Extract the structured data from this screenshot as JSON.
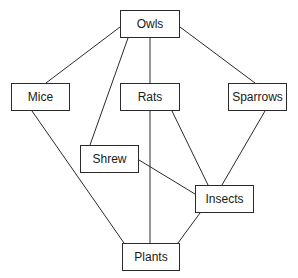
{
  "diagram": {
    "type": "food-web",
    "nodes": [
      {
        "id": "owls",
        "label": "Owls",
        "x": 120,
        "y": 10,
        "w": 60,
        "h": 28
      },
      {
        "id": "mice",
        "label": "Mice",
        "x": 11,
        "y": 83,
        "w": 59,
        "h": 28
      },
      {
        "id": "rats",
        "label": "Rats",
        "x": 120,
        "y": 83,
        "w": 60,
        "h": 28
      },
      {
        "id": "sparrows",
        "label": "Sparrows",
        "x": 228,
        "y": 83,
        "w": 59,
        "h": 28
      },
      {
        "id": "shrew",
        "label": "Shrew",
        "x": 80,
        "y": 145,
        "w": 59,
        "h": 28
      },
      {
        "id": "insects",
        "label": "Insects",
        "x": 195,
        "y": 185,
        "w": 59,
        "h": 28
      },
      {
        "id": "plants",
        "label": "Plants",
        "x": 122,
        "y": 243,
        "w": 58,
        "h": 28
      }
    ],
    "edges": [
      {
        "from": "owls",
        "to": "mice",
        "x1": 120,
        "y1": 27,
        "x2": 46,
        "y2": 83
      },
      {
        "from": "owls",
        "to": "shrew",
        "x1": 128,
        "y1": 38,
        "x2": 90,
        "y2": 145
      },
      {
        "from": "owls",
        "to": "rats",
        "x1": 150,
        "y1": 38,
        "x2": 150,
        "y2": 83
      },
      {
        "from": "owls",
        "to": "sparrows",
        "x1": 180,
        "y1": 27,
        "x2": 255,
        "y2": 83
      },
      {
        "from": "mice",
        "to": "plants",
        "x1": 32,
        "y1": 111,
        "x2": 124,
        "y2": 243
      },
      {
        "from": "rats",
        "to": "plants",
        "x1": 150,
        "y1": 111,
        "x2": 150,
        "y2": 243
      },
      {
        "from": "rats",
        "to": "insects",
        "x1": 172,
        "y1": 111,
        "x2": 208,
        "y2": 185
      },
      {
        "from": "sparrows",
        "to": "insects",
        "x1": 265,
        "y1": 111,
        "x2": 222,
        "y2": 185
      },
      {
        "from": "shrew",
        "to": "insects",
        "x1": 139,
        "y1": 160,
        "x2": 195,
        "y2": 194
      },
      {
        "from": "insects",
        "to": "plants",
        "x1": 200,
        "y1": 213,
        "x2": 178,
        "y2": 243
      }
    ],
    "line_color": "#2a2a2a"
  }
}
